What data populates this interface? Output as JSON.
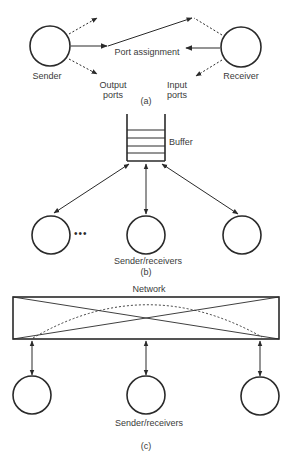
{
  "panel_a": {
    "sender_label": "Sender",
    "receiver_label": "Receiver",
    "port_assignment_label": "Port assignment",
    "output_ports_line1": "Output",
    "output_ports_line2": "ports",
    "input_ports_line1": "Input",
    "input_ports_line2": "ports",
    "caption": "(a)"
  },
  "panel_b": {
    "buffer_label": "Buffer",
    "ellipsis": "•••",
    "nodes_label": "Sender/receivers",
    "caption": "(b)"
  },
  "panel_c": {
    "network_label": "Network",
    "nodes_label": "Sender/receivers",
    "caption": "(c)"
  },
  "colors": {
    "stroke": "#2a2a2a",
    "text": "#3a3a3a",
    "background": "#ffffff"
  }
}
